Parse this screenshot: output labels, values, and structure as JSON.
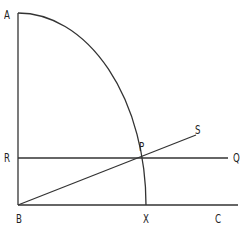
{
  "diagram": {
    "stroke_color": "#333333",
    "points": {
      "A": {
        "label": "A",
        "x": 18,
        "y": 13
      },
      "B": {
        "label": "B",
        "x": 18,
        "y": 205
      },
      "C": {
        "label": "C",
        "x": 238,
        "y": 205
      },
      "R": {
        "label": "R",
        "x": 18,
        "y": 158
      },
      "Q": {
        "label": "Q",
        "x": 228,
        "y": 158
      },
      "P": {
        "label": "P",
        "x": 138,
        "y": 158
      },
      "S": {
        "label": "S",
        "x": 196,
        "y": 135
      },
      "X": {
        "label": "X",
        "x": 146,
        "y": 205
      }
    },
    "segments": [
      {
        "name": "AB",
        "from": "A",
        "to": "B"
      },
      {
        "name": "BC",
        "from": "B",
        "to": "C"
      },
      {
        "name": "RQ",
        "from": "R",
        "to": "Q"
      },
      {
        "name": "BS",
        "from": "B",
        "to": "S"
      }
    ],
    "arcs": [
      {
        "name": "arc-AX",
        "from": "A",
        "to": "X",
        "center": "B"
      }
    ]
  }
}
